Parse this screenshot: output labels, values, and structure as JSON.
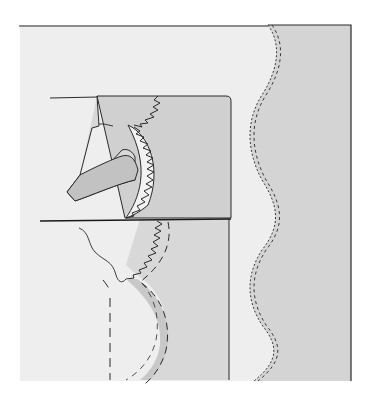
{
  "figure": {
    "title": "",
    "colors": {
      "background": "#ffffff",
      "light_fabric": "#eeeeee",
      "mid_fabric": "#d6d6d6",
      "dark_fabric": "#c9c9c9",
      "line": "#2a2a2a",
      "stitch": "#3a3a3a"
    },
    "labels": []
  }
}
